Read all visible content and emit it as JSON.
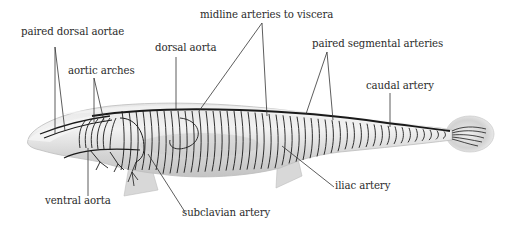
{
  "figure": {
    "colors": {
      "background": "#ffffff",
      "body_fill": "#d9d9d9",
      "body_light": "#eeeeee",
      "vessel": "#1a1a1a",
      "leader": "#333333",
      "text": "#2b2b2b"
    }
  },
  "labels": [
    {
      "id": "paired-dorsal-aortae",
      "text": "paired dorsal aortae"
    },
    {
      "id": "aortic-arches",
      "text": "aortic arches"
    },
    {
      "id": "dorsal-aorta",
      "text": "dorsal aorta"
    },
    {
      "id": "midline-arteries-to-viscera",
      "text": "midline arteries to viscera"
    },
    {
      "id": "paired-segmental-arteries",
      "text": "paired segmental arteries"
    },
    {
      "id": "caudal-artery",
      "text": "caudal artery"
    },
    {
      "id": "ventral-aorta",
      "text": "ventral aorta"
    },
    {
      "id": "subclavian-artery",
      "text": "subclavian artery"
    },
    {
      "id": "iliac-artery",
      "text": "iliac artery"
    }
  ]
}
